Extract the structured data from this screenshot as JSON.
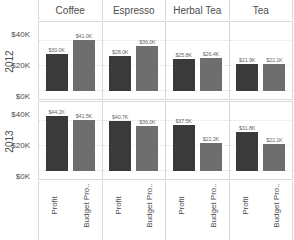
{
  "chart_data": {
    "type": "bar",
    "title": "",
    "xlabel": "",
    "ylabel": "",
    "ylim": [
      0,
      50
    ],
    "yticks": [
      "$0K",
      "$20K",
      "$40K"
    ],
    "grid": true,
    "legend_position": "none",
    "categories": [
      "Coffee",
      "Espresso",
      "Herbal Tea",
      "Tea"
    ],
    "row_labels": [
      "2012",
      "2013"
    ],
    "measures": [
      "Profit",
      "Budget Pro.."
    ],
    "colors": {
      "profit": "#3a3a3a",
      "budget_profit": "#6e6e6e",
      "gridline": "#e2e2e2",
      "border": "#d9d9d9",
      "text": "#4d4d4d",
      "value_label": "#6b6b6b"
    },
    "panels": [
      {
        "year": "2012",
        "cells": [
          {
            "category": "Coffee",
            "bars": [
              {
                "measure": "Profit",
                "value": 30.0,
                "label": "$30.0K"
              },
              {
                "measure": "Budget Pro..",
                "value": 41.0,
                "label": "$41.0K"
              }
            ]
          },
          {
            "category": "Espresso",
            "bars": [
              {
                "measure": "Profit",
                "value": 28.0,
                "label": "$28.0K"
              },
              {
                "measure": "Budget Pro..",
                "value": 36.0,
                "label": "$36.0K"
              }
            ]
          },
          {
            "category": "Herbal Tea",
            "bars": [
              {
                "measure": "Profit",
                "value": 25.8,
                "label": "$25.8K"
              },
              {
                "measure": "Budget Pro..",
                "value": 26.4,
                "label": "$26.4K"
              }
            ]
          },
          {
            "category": "Tea",
            "bars": [
              {
                "measure": "Profit",
                "value": 21.9,
                "label": "$21.9K"
              },
              {
                "measure": "Budget Pro..",
                "value": 22.1,
                "label": "$22.1K"
              }
            ]
          }
        ]
      },
      {
        "year": "2013",
        "cells": [
          {
            "category": "Coffee",
            "bars": [
              {
                "measure": "Profit",
                "value": 44.2,
                "label": "$44.2K"
              },
              {
                "measure": "Budget Pro..",
                "value": 41.5,
                "label": "$41.5K"
              }
            ]
          },
          {
            "category": "Espresso",
            "bars": [
              {
                "measure": "Profit",
                "value": 40.7,
                "label": "$40.7K"
              },
              {
                "measure": "Budget Pro..",
                "value": 36.0,
                "label": "$36.0K"
              }
            ]
          },
          {
            "category": "Herbal Tea",
            "bars": [
              {
                "measure": "Profit",
                "value": 37.5,
                "label": "$37.5K"
              },
              {
                "measure": "Budget Pro..",
                "value": 22.2,
                "label": "$22.2K"
              }
            ]
          },
          {
            "category": "Tea",
            "bars": [
              {
                "measure": "Profit",
                "value": 31.8,
                "label": "$31.8K"
              },
              {
                "measure": "Budget Pro..",
                "value": 22.1,
                "label": "$22.1K"
              }
            ]
          }
        ]
      }
    ]
  },
  "axis": {
    "tick_40": "$40K",
    "tick_20": "$20K",
    "tick_0": "$0K"
  },
  "headers": {
    "c0": "Coffee",
    "c1": "Espresso",
    "c2": "Herbal Tea",
    "c3": "Tea"
  },
  "years": {
    "y2012": "2012",
    "y2013": "2013"
  },
  "measures": {
    "profit": "Profit",
    "budget": "Budget Pro.."
  }
}
